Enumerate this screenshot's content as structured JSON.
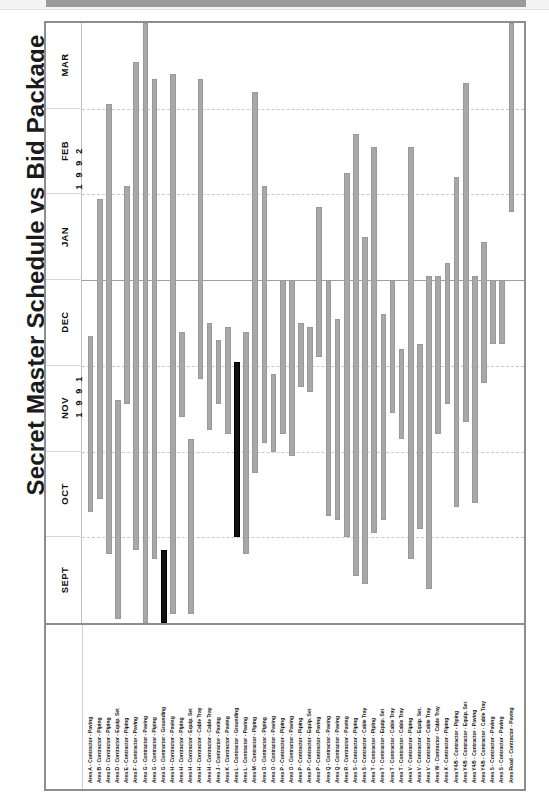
{
  "page": {
    "title": "Secret Master Schedule vs Bid Package",
    "caption": ""
  },
  "axis": {
    "years": [
      {
        "label": "1 9 9 1"
      },
      {
        "label": "1 9 9 2"
      }
    ],
    "months": [
      "MAR",
      "FEB",
      "JAN",
      "DEC",
      "NOV",
      "OCT",
      "SEPT"
    ]
  },
  "legend": {
    "normal_color": "#a8a8a8",
    "highlight_color": "#111111"
  },
  "chart_data": {
    "type": "bar",
    "orientation": "vertical-gantt",
    "title": "Secret Master Schedule vs Bid Package",
    "xlabel": "",
    "ylabel": "",
    "grid": true,
    "legend_position": "none",
    "y_axis_months": [
      "SEPT",
      "OCT",
      "NOV",
      "DEC",
      "JAN",
      "FEB",
      "MAR"
    ],
    "y_axis_years": [
      "1991",
      "1991",
      "1991",
      "1991",
      "1992",
      "1992",
      "1992"
    ],
    "ylim": [
      "1991-08-15",
      "1992-03-31"
    ],
    "note": "start/end are month-fractions where 0 = start of SEPT 1991 and 7 = end of MAR 1992",
    "categories": [
      "Area A - Contractor - Paving",
      "Area B - Contractor - Piping",
      "Area D - Contractor - Piping",
      "Area D - Contractor - Equip. Set",
      "Area E - Contractor - Piping",
      "Area F - Contractor - Paving",
      "Area G - Contractor - Paving",
      "Area G - Contractor - Piping",
      "Area G - Contractor - Grounding",
      "Area H - Contractor - Paving",
      "Area H - Contractor - Piping",
      "Area H - Contractor - Equip. Set",
      "Area H - Contractor - Cable Tray",
      "Area H - Contractor - Cable Tray",
      "Area J - Contractor - Paving",
      "Area K - Contractor - Paving",
      "Area L - Contractor - Grounding",
      "Area L - Contractor - Paving",
      "Area M - Contractor - Piping",
      "Area O - Contractor - Piping",
      "Area O - Contractor - Paving",
      "Area P - Contractor - Piping",
      "Area O - Contractor - Paving",
      "Area P - Contractor - Piping",
      "Area P - Contractor - Equip. Set",
      "Area P - Contractor - Paving",
      "Area Q - Contractor - Paving",
      "Area Q - Contractor - Paving",
      "Area R - Contractor - Paving",
      "Area S - Contractor - Piping",
      "Area S - Contractor - Cable Tray",
      "Area T - Contractor - Piping",
      "Area T - Contractor - Equip. Set",
      "Area T - Contractor - Cable Tray",
      "Area T - Contractor - Cable Tray",
      "Area V - Contractor - Piping",
      "Area V - Contractor - Equip. Set.",
      "Area V - Contractor - Cable Tray",
      "Area W - Contractor - Cable Tray",
      "Area X - Contractor - Piping",
      "Area Y4/5 - Contractor - Piping",
      "Area Y4/5 - Contractor - Equip. Set",
      "Area Y4/5 - Contractor - Paving",
      "Area Y4/5 - Contractor - Cable Tray",
      "Area S - Contractor - Paving",
      "Area S - Contractor - Paving",
      "Area Road - Contractor - Paving"
    ],
    "bars": [
      {
        "label": "Area A - Contractor - Paving",
        "start": 1.3,
        "end": 3.35,
        "highlight": false
      },
      {
        "label": "Area B - Contractor - Piping",
        "start": 1.45,
        "end": 4.95,
        "highlight": false
      },
      {
        "label": "Area D - Contractor - Piping",
        "start": 0.8,
        "end": 6.05,
        "highlight": false
      },
      {
        "label": "Area D - Contractor - Equip. Set",
        "start": 0.05,
        "end": 2.6,
        "highlight": false
      },
      {
        "label": "Area E - Contractor - Piping",
        "start": 2.55,
        "end": 5.1,
        "highlight": false
      },
      {
        "label": "Area F - Contractor - Paving",
        "start": 0.85,
        "end": 6.55,
        "highlight": false
      },
      {
        "label": "Area G - Contractor - Paving",
        "start": 0.0,
        "end": 7.0,
        "highlight": false
      },
      {
        "label": "Area G - Contractor - Piping",
        "start": 0.75,
        "end": 6.35,
        "highlight": false
      },
      {
        "label": "Area G - Contractor - Grounding",
        "start": 0.0,
        "end": 0.85,
        "highlight": true
      },
      {
        "label": "Area H - Contractor - Paving",
        "start": 0.1,
        "end": 6.4,
        "highlight": false
      },
      {
        "label": "Area H - Contractor - Piping",
        "start": 2.4,
        "end": 3.4,
        "highlight": false
      },
      {
        "label": "Area H - Contractor - Equip. Set",
        "start": 0.1,
        "end": 2.15,
        "highlight": false
      },
      {
        "label": "Area H - Contractor - Cable Tray",
        "start": 2.85,
        "end": 6.35,
        "highlight": false
      },
      {
        "label": "Area H - Contractor - Cable Tray",
        "start": 2.25,
        "end": 3.5,
        "highlight": false
      },
      {
        "label": "Area J - Contractor - Paving",
        "start": 2.55,
        "end": 3.3,
        "highlight": false
      },
      {
        "label": "Area K - Contractor - Paving",
        "start": 2.2,
        "end": 3.45,
        "highlight": false
      },
      {
        "label": "Area L - Contractor - Grounding",
        "start": 1.0,
        "end": 3.05,
        "highlight": true
      },
      {
        "label": "Area L - Contractor - Paving",
        "start": 0.8,
        "end": 3.4,
        "highlight": false
      },
      {
        "label": "Area M - Contractor - Piping",
        "start": 1.75,
        "end": 6.2,
        "highlight": false
      },
      {
        "label": "Area O - Contractor - Piping",
        "start": 2.1,
        "end": 5.1,
        "highlight": false
      },
      {
        "label": "Area O - Contractor - Paving",
        "start": 2.0,
        "end": 2.9,
        "highlight": false
      },
      {
        "label": "Area P - Contractor - Piping",
        "start": 2.2,
        "end": 4.0,
        "highlight": false
      },
      {
        "label": "Area O - Contractor - Paving",
        "start": 1.95,
        "end": 4.0,
        "highlight": false
      },
      {
        "label": "Area P - Contractor - Piping",
        "start": 2.75,
        "end": 3.5,
        "highlight": false
      },
      {
        "label": "Area P - Contractor - Equip. Set",
        "start": 2.7,
        "end": 3.45,
        "highlight": false
      },
      {
        "label": "Area P - Contractor - Paving",
        "start": 3.1,
        "end": 4.85,
        "highlight": false
      },
      {
        "label": "Area Q - Contractor - Paving",
        "start": 1.25,
        "end": 4.0,
        "highlight": false
      },
      {
        "label": "Area Q - Contractor - Paving",
        "start": 1.2,
        "end": 3.55,
        "highlight": false
      },
      {
        "label": "Area R - Contractor - Paving",
        "start": 1.0,
        "end": 5.25,
        "highlight": false
      },
      {
        "label": "Area S - Contractor - Piping",
        "start": 0.55,
        "end": 5.7,
        "highlight": false
      },
      {
        "label": "Area S - Contractor - Cable Tray",
        "start": 0.45,
        "end": 4.5,
        "highlight": false
      },
      {
        "label": "Area T - Contractor - Piping",
        "start": 1.05,
        "end": 5.55,
        "highlight": false
      },
      {
        "label": "Area T - Contractor - Equip. Set",
        "start": 1.2,
        "end": 3.6,
        "highlight": false
      },
      {
        "label": "Area T - Contractor - Cable Tray",
        "start": 2.45,
        "end": 4.0,
        "highlight": false
      },
      {
        "label": "Area T - Contractor - Cable Tray",
        "start": 2.15,
        "end": 3.2,
        "highlight": false
      },
      {
        "label": "Area V - Contractor - Piping",
        "start": 0.75,
        "end": 5.55,
        "highlight": false
      },
      {
        "label": "Area V - Contractor - Equip. Set.",
        "start": 1.1,
        "end": 3.25,
        "highlight": false
      },
      {
        "label": "Area V - Contractor - Cable Tray",
        "start": 0.4,
        "end": 4.05,
        "highlight": false
      },
      {
        "label": "Area W - Contractor - Cable Tray",
        "start": 2.2,
        "end": 4.05,
        "highlight": false
      },
      {
        "label": "Area X - Contractor - Piping",
        "start": 2.55,
        "end": 4.2,
        "highlight": false
      },
      {
        "label": "Area Y4/5 - Contractor - Piping",
        "start": 1.35,
        "end": 5.2,
        "highlight": false
      },
      {
        "label": "Area Y4/5 - Contractor - Equip. Set",
        "start": 2.35,
        "end": 6.3,
        "highlight": false
      },
      {
        "label": "Area Y4/5 - Contractor - Paving",
        "start": 1.4,
        "end": 4.05,
        "highlight": false
      },
      {
        "label": "Area Y4/5 - Contractor - Cable Tray",
        "start": 2.8,
        "end": 4.45,
        "highlight": false
      },
      {
        "label": "Area S - Contractor - Paving",
        "start": 3.25,
        "end": 4.0,
        "highlight": false
      },
      {
        "label": "Area S - Contractor - Paving",
        "start": 3.25,
        "end": 4.0,
        "highlight": false
      },
      {
        "label": "Area Road - Contractor - Paving",
        "start": 4.85,
        "end": 7.05,
        "highlight": false
      }
    ]
  }
}
